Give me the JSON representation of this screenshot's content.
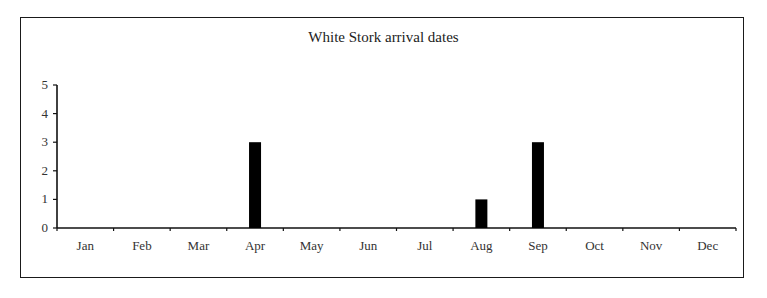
{
  "chart_data": {
    "type": "bar",
    "title": "White Stork arrival dates",
    "xlabel": "",
    "ylabel": "",
    "categories": [
      "Jan",
      "Feb",
      "Mar",
      "Apr",
      "May",
      "Jun",
      "Jul",
      "Aug",
      "Sep",
      "Oct",
      "Nov",
      "Dec"
    ],
    "values": [
      0,
      0,
      0,
      3,
      0,
      0,
      0,
      1,
      3,
      0,
      0,
      0
    ],
    "ylim": [
      0,
      5
    ],
    "yticks": [
      0,
      1,
      2,
      3,
      4,
      5
    ],
    "grid": false,
    "legend": null,
    "bar_color": "#000000"
  }
}
